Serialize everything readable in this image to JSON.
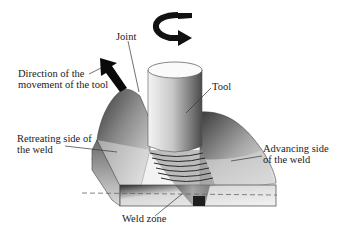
{
  "diagram": {
    "labels": {
      "joint": "Joint",
      "tool": "Tool",
      "direction": [
        "Direction of the",
        "movement of the tool"
      ],
      "retreating": [
        "Retreating side of",
        "the weld"
      ],
      "advancing": [
        "Advancing side",
        "of the weld"
      ],
      "weld_zone": "Weld zone"
    },
    "icons": {
      "rotation": "curved-rotation-arrow",
      "direction": "straight-thick-arrow"
    },
    "colors": {
      "background": "#ffffff",
      "ink": "#1a1a1a",
      "metal_light": "#e6e6e6",
      "metal_dark": "#3a3a3a"
    }
  }
}
